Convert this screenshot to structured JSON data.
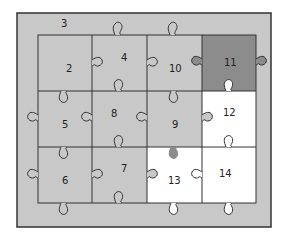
{
  "diagram": {
    "type": "jigsaw-puzzle-grid",
    "frame_label": "3",
    "colors": {
      "frame": "#c8c8c8",
      "piece_default": "#c8c8c8",
      "piece_highlight": "#8c8c8c",
      "piece_empty": "#ffffff",
      "line": "#333333"
    },
    "pieces": [
      {
        "label": "2",
        "row": 0,
        "col": 0,
        "fill": "default"
      },
      {
        "label": "4",
        "row": 0,
        "col": 1,
        "fill": "default"
      },
      {
        "label": "10",
        "row": 0,
        "col": 2,
        "fill": "default"
      },
      {
        "label": "11",
        "row": 0,
        "col": 3,
        "fill": "highlight"
      },
      {
        "label": "5",
        "row": 1,
        "col": 0,
        "fill": "default"
      },
      {
        "label": "8",
        "row": 1,
        "col": 1,
        "fill": "default"
      },
      {
        "label": "9",
        "row": 1,
        "col": 2,
        "fill": "default"
      },
      {
        "label": "12",
        "row": 1,
        "col": 3,
        "fill": "empty"
      },
      {
        "label": "6",
        "row": 2,
        "col": 0,
        "fill": "default"
      },
      {
        "label": "7",
        "row": 2,
        "col": 1,
        "fill": "default"
      },
      {
        "label": "13",
        "row": 2,
        "col": 2,
        "fill": "empty"
      },
      {
        "label": "14",
        "row": 2,
        "col": 3,
        "fill": "empty"
      }
    ]
  }
}
